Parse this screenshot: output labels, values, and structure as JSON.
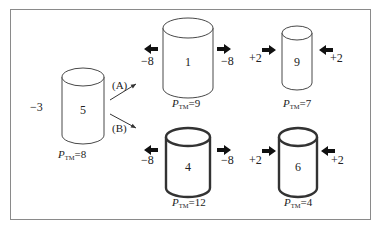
{
  "colors": {
    "stroke": "#333333",
    "frame": "#8a8a8a",
    "arrow": "#111111"
  },
  "source": {
    "value": "5",
    "charge_left": "−3",
    "ptm_label": "P",
    "ptm_sub": "TM",
    "ptm_value": "=8",
    "cylinder": {
      "cx": 83,
      "top": 77,
      "bottom": 135,
      "rx": 21,
      "ry": 9,
      "thick": false
    }
  },
  "paths": [
    {
      "label": "(A)",
      "from": [
        110,
        100
      ],
      "to": [
        136,
        84
      ],
      "label_xy": [
        112,
        89
      ]
    },
    {
      "label": "(B)",
      "from": [
        110,
        114
      ],
      "to": [
        136,
        128
      ],
      "label_xy": [
        112,
        132
      ]
    }
  ],
  "results": [
    {
      "id": "a1",
      "value": "1",
      "ptm_value": "=9",
      "cylinder": {
        "cx": 188,
        "top": 28,
        "bottom": 88,
        "rx": 25,
        "ry": 10,
        "thick": false
      },
      "left": {
        "text": "−8",
        "dir": "out",
        "arrow_x": 144,
        "arrow_y": 49,
        "text_xy": [
          141,
          65
        ]
      },
      "right": {
        "text": "−8",
        "dir": "out",
        "arrow_x": 217,
        "arrow_y": 49,
        "text_xy": [
          221,
          65
        ]
      },
      "ptm_xy": [
        172,
        107
      ]
    },
    {
      "id": "a2",
      "value": "9",
      "ptm_value": "=7",
      "cylinder": {
        "cx": 297,
        "top": 33,
        "bottom": 83,
        "rx": 15,
        "ry": 7,
        "thick": false
      },
      "left": {
        "text": "+2",
        "dir": "in",
        "arrow_x": 262,
        "arrow_y": 50,
        "text_xy": [
          249,
          62
        ]
      },
      "right": {
        "text": "+2",
        "dir": "in",
        "arrow_x": 319,
        "arrow_y": 50,
        "text_xy": [
          330,
          62
        ]
      },
      "ptm_xy": [
        283,
        107
      ]
    },
    {
      "id": "b1",
      "value": "4",
      "ptm_value": "=12",
      "cylinder": {
        "cx": 188,
        "top": 137,
        "bottom": 188,
        "rx": 22,
        "ry": 9,
        "thick": true
      },
      "left": {
        "text": "−8",
        "dir": "out",
        "arrow_x": 144,
        "arrow_y": 150,
        "text_xy": [
          141,
          164
        ]
      },
      "right": {
        "text": "−8",
        "dir": "out",
        "arrow_x": 217,
        "arrow_y": 150,
        "text_xy": [
          221,
          164
        ]
      },
      "ptm_xy": [
        172,
        206
      ]
    },
    {
      "id": "b2",
      "value": "6",
      "ptm_value": "=4",
      "cylinder": {
        "cx": 298,
        "top": 137,
        "bottom": 188,
        "rx": 19,
        "ry": 9,
        "thick": true
      },
      "left": {
        "text": "+2",
        "dir": "in",
        "arrow_x": 262,
        "arrow_y": 151,
        "text_xy": [
          249,
          164
        ]
      },
      "right": {
        "text": "+2",
        "dir": "in",
        "arrow_x": 321,
        "arrow_y": 151,
        "text_xy": [
          331,
          164
        ]
      },
      "ptm_xy": [
        284,
        206
      ]
    }
  ]
}
